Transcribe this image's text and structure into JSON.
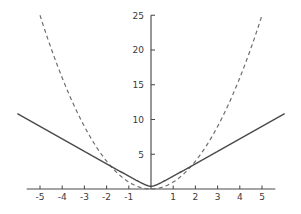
{
  "chart_data": {
    "type": "line",
    "title": "",
    "xlabel": "",
    "ylabel": "",
    "xlim": [
      -5.6,
      5.6
    ],
    "ylim": [
      0,
      25
    ],
    "grid": false,
    "legend": "none",
    "background_color": "#ffffff",
    "axis_color": "#4a4a4a",
    "x_ticks": [
      -5,
      -4,
      -3,
      -2,
      -1,
      1,
      2,
      3,
      4,
      5
    ],
    "x_tick_labels": [
      "-5",
      "-4",
      "-3",
      "-2",
      "-1",
      "1",
      "2",
      "3",
      "4",
      "5"
    ],
    "y_ticks": [
      5,
      10,
      15,
      20,
      25
    ],
    "y_tick_labels": [
      "5",
      "10",
      "15",
      "20",
      "25"
    ],
    "series": [
      {
        "name": "quadratic",
        "style": "dashed",
        "color": "#6e6e6e",
        "expression": "x^2",
        "x": [
          -5,
          -4.5,
          -4,
          -3.5,
          -3,
          -2.5,
          -2,
          -1.5,
          -1,
          -0.5,
          0,
          0.5,
          1,
          1.5,
          2,
          2.5,
          3,
          3.5,
          4,
          4.5,
          5
        ],
        "values": [
          25,
          20.25,
          16,
          12.25,
          9,
          6.25,
          4,
          2.25,
          1,
          0.25,
          0,
          0.25,
          1,
          2.25,
          4,
          6.25,
          9,
          12.25,
          16,
          20.25,
          25
        ]
      },
      {
        "name": "smoothed-absolute",
        "style": "solid",
        "color": "#4b4b4b",
        "expression": "1.8*sqrt(x^2 + 0.05)",
        "x": [
          -5,
          -4.5,
          -4,
          -3.5,
          -3,
          -2.5,
          -2,
          -1.5,
          -1,
          -0.75,
          -0.5,
          -0.25,
          0,
          0.25,
          0.5,
          0.75,
          1,
          1.5,
          2,
          2.5,
          3,
          3.5,
          4,
          4.5,
          5
        ],
        "values": [
          9.0,
          8.1,
          7.21,
          6.31,
          5.41,
          4.51,
          3.62,
          2.72,
          1.84,
          1.41,
          0.99,
          0.63,
          0.4,
          0.63,
          0.99,
          1.41,
          1.84,
          2.72,
          3.62,
          4.51,
          5.41,
          6.31,
          7.21,
          8.1,
          9.0
        ]
      }
    ]
  }
}
